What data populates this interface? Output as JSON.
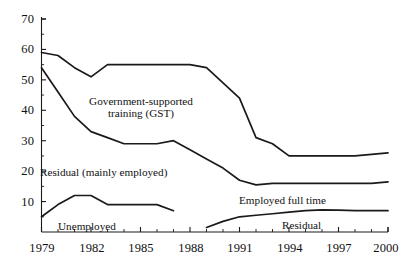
{
  "chart_data": {
    "type": "line",
    "title": "",
    "subtitle": "",
    "xlabel": "",
    "ylabel": "",
    "xlim": [
      1979,
      2000
    ],
    "ylim": [
      0,
      70
    ],
    "grid": false,
    "legend_position": "inline-annotations",
    "y_ticks": [
      70,
      60,
      50,
      40,
      30,
      20,
      10
    ],
    "y_tick_labels": [
      "70",
      "60",
      "50",
      "40",
      "30",
      "20",
      "10"
    ],
    "x_ticks": [
      1979,
      1982,
      1985,
      1988,
      1991,
      1994,
      1997,
      2000
    ],
    "x_tick_labels": [
      "1979",
      "1982",
      "1985",
      "1988",
      "1991",
      "1994",
      "1997",
      "2000"
    ],
    "x_minor_ticks": [
      1980,
      1981,
      1983,
      1984,
      1986,
      1987,
      1989,
      1990,
      1992,
      1993,
      1995,
      1996,
      1998,
      1999
    ],
    "y_minor_ticks": [
      65,
      55,
      45,
      35,
      25,
      15,
      5
    ],
    "series": [
      {
        "name": "Government-supported training (GST)",
        "label": "Government-supported\ntraining (GST)",
        "x": [
          1979,
          1980,
          1981,
          1982,
          1983,
          1984,
          1985,
          1986,
          1987,
          1988,
          1989,
          1990,
          1991,
          1992,
          1993,
          1994,
          1995,
          1996,
          1997,
          1998,
          1999,
          2000
        ],
        "values": [
          59,
          58,
          54,
          51,
          55,
          55,
          55,
          55,
          55,
          55,
          54,
          49,
          44,
          31,
          29,
          25,
          25,
          25,
          25,
          25,
          25.5,
          26
        ]
      },
      {
        "name": "Residual (mainly employed)",
        "label": "Residual (mainly employed)",
        "x": [
          1979,
          1980,
          1981,
          1982,
          1983,
          1984,
          1985,
          1986,
          1987,
          1988,
          1989,
          1990,
          1991,
          1992,
          1993,
          1994,
          1995,
          1996,
          1997,
          1998,
          1999,
          2000
        ],
        "values": [
          54,
          46,
          38,
          33,
          31,
          29,
          29,
          29,
          30,
          27,
          24,
          21,
          17,
          15.5,
          16,
          16,
          16,
          16,
          16,
          16,
          16,
          16.5
        ]
      },
      {
        "name": "Unemployed",
        "label": "Unemployed",
        "x": [
          1979,
          1980,
          1981,
          1982,
          1983,
          1984,
          1985,
          1986,
          1987
        ],
        "values": [
          5,
          9,
          12,
          12,
          9,
          9,
          9,
          9,
          7
        ]
      },
      {
        "name": "Residual",
        "label": "Residual",
        "x": [
          1989,
          1990,
          1991,
          1992,
          1993,
          1994,
          1995,
          1996,
          1997,
          1998,
          1999,
          2000
        ],
        "values": [
          1.5,
          3.5,
          5,
          5.5,
          6,
          6.5,
          7,
          7.3,
          7.2,
          7,
          7,
          7
        ]
      }
    ],
    "annotations": [
      {
        "name": "gst-label",
        "text_line1": "Government-supported",
        "text_line2": "training (GST)"
      },
      {
        "name": "residual-mainly-employed-label",
        "text": "Residual (mainly employed)"
      },
      {
        "name": "unemployed-label",
        "text": "Unemployed"
      },
      {
        "name": "employed-full-time-label",
        "text": "Employed full time"
      },
      {
        "name": "residual-label",
        "text": "Residual"
      }
    ],
    "colors": {
      "line": "#1a1a1a",
      "axis": "#1a1a1a",
      "background": "#ffffff"
    }
  }
}
